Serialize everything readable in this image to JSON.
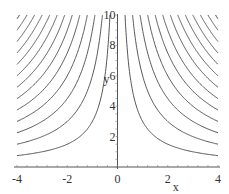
{
  "chart_data": {
    "type": "line",
    "title": "",
    "xlabel": "x",
    "ylabel": "y",
    "xlim": [
      -4,
      4
    ],
    "ylim": [
      0,
      10
    ],
    "grid": false,
    "legend": "none",
    "x_ticks": [
      "-4",
      "-2",
      "0",
      "2",
      "4"
    ],
    "y_ticks": [
      "2",
      "4",
      "6",
      "8",
      "10"
    ],
    "contour_levels": [
      3,
      6,
      9,
      12,
      15,
      18,
      21,
      24,
      27,
      30,
      33,
      36,
      39
    ],
    "x_tick_values": [
      -4,
      -2,
      0,
      2,
      4
    ],
    "y_tick_values": [
      2,
      4,
      6,
      8,
      10
    ]
  }
}
